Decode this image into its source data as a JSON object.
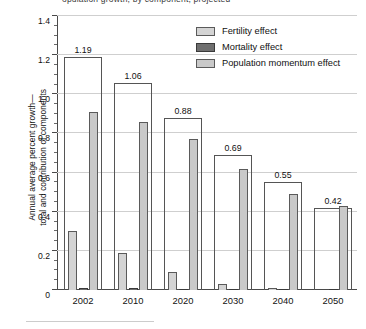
{
  "figure": {
    "top_clipped_caption": "opulation growth, by component, projected",
    "bottom_rule": true
  },
  "legend": {
    "position": "top-right",
    "items": [
      {
        "label": "Fertility effect",
        "key": "fertility",
        "color": "#d4d4d4"
      },
      {
        "label": "Mortality effect",
        "key": "mortality",
        "color": "#6f6f6f"
      },
      {
        "label": "Population momentum effect",
        "key": "momentum",
        "color": "#c9c9c9"
      }
    ]
  },
  "axes": {
    "ylabel_line1": "Annual average percent growth—",
    "ylabel_line2": "total and contribution of components",
    "ytick_labels": [
      "0",
      "0.2",
      "0.4",
      "0.6",
      "0.8",
      "1.0",
      "1.2",
      "1.4"
    ],
    "ytick_values": [
      0,
      0.2,
      0.4,
      0.6,
      0.8,
      1.0,
      1.2,
      1.4
    ],
    "yminor_step": 0.05,
    "ylim": [
      0,
      1.4
    ],
    "xlabel": "",
    "grid": "horizontal"
  },
  "chart_data": {
    "type": "bar",
    "title": "",
    "subtitle": "",
    "xlabel": "",
    "ylabel": "Annual average percent growth—total and contribution of components",
    "ylim": [
      0,
      1.4
    ],
    "grid": true,
    "legend_position": "top-right",
    "categories": [
      "2002",
      "2010",
      "2020",
      "2030",
      "2040",
      "2050"
    ],
    "totals": {
      "name": "Total annual average percent growth",
      "style": "outline",
      "values": [
        1.19,
        1.06,
        0.88,
        0.69,
        0.55,
        0.42
      ],
      "labels": [
        "1.19",
        "1.06",
        "0.88",
        "0.69",
        "0.55",
        "0.42"
      ]
    },
    "series": [
      {
        "name": "Fertility effect",
        "color": "#d4d4d4",
        "values": [
          0.3,
          0.19,
          0.09,
          0.03,
          0.012,
          0.0
        ]
      },
      {
        "name": "Mortality effect",
        "color": "#6f6f6f",
        "values": [
          0.01,
          0.008,
          0.006,
          0.005,
          0.004,
          0.004
        ]
      },
      {
        "name": "Population momentum effect",
        "color": "#c9c9c9",
        "values": [
          0.91,
          0.86,
          0.77,
          0.62,
          0.49,
          0.43
        ]
      }
    ]
  }
}
